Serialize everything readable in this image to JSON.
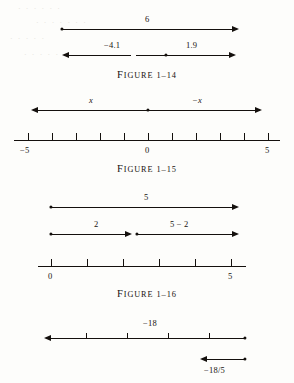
{
  "figures": [
    {
      "id": "figure-1-14",
      "caption_word": "Figure",
      "caption_number": "1–14",
      "arrows": [
        {
          "label": "6",
          "direction": "right"
        },
        {
          "label": "−4.1",
          "direction": "left"
        },
        {
          "label": "1.9",
          "direction": "right"
        }
      ]
    },
    {
      "id": "figure-1-15",
      "caption_word": "Figure",
      "caption_number": "1–15",
      "arrows": [
        {
          "label": "x",
          "direction": "left"
        },
        {
          "label": "−x",
          "direction": "right"
        }
      ],
      "axis": {
        "min_label": "−5",
        "zero_label": "0",
        "max_label": "5",
        "ticks": 11
      }
    },
    {
      "id": "figure-1-16",
      "caption_word": "Figure",
      "caption_number": "1–16",
      "arrows": [
        {
          "label": "5",
          "direction": "right"
        },
        {
          "label": "2",
          "direction": "right"
        },
        {
          "label": "5 − 2",
          "direction": "right"
        }
      ],
      "axis": {
        "min_label": "0",
        "max_label": "5",
        "ticks": 6
      }
    },
    {
      "id": "figure-bottom",
      "arrows": [
        {
          "label": "−18",
          "direction": "left"
        },
        {
          "label": "−18/5",
          "direction": "left"
        }
      ]
    }
  ],
  "ghost_text": {
    "line1": "· · · · · ·",
    "line2": "· · · · · · ·",
    "line3": "· · · · ·",
    "line4": "· · · · · ·"
  },
  "colors": {
    "ink": "#14100d",
    "paper": "#fdfdfb"
  }
}
